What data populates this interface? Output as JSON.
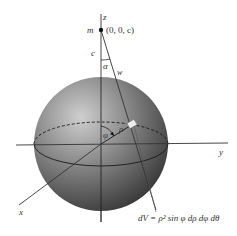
{
  "diagram": {
    "type": "3D sphere with spherical coordinates",
    "labels": {
      "z_axis": "z",
      "y_axis": "y",
      "x_axis": "x",
      "mass": "m",
      "point": "(0, 0, c)",
      "c": "c",
      "alpha": "α",
      "w": "w",
      "phi": "φ",
      "rho": "ρ",
      "volume_element": "dV = ρ² sin φ dρ dφ dθ"
    },
    "colors": {
      "sphere_light": "#c8c8c8",
      "sphere_dark": "#2a2a2a",
      "axis": "#333333",
      "background": "#ffffff"
    }
  }
}
